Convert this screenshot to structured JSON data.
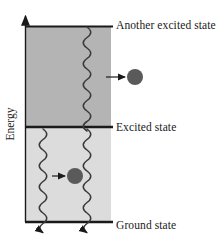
{
  "figure": {
    "kind": "energy-level-diagram",
    "axis": {
      "label": "Energy",
      "direction": "up"
    },
    "levels": [
      {
        "id": "another-excited",
        "label": "Another excited state",
        "y": 26
      },
      {
        "id": "excited",
        "label": "Excited state",
        "y": 127
      },
      {
        "id": "ground",
        "label": "Ground state",
        "y": 222
      }
    ],
    "bands": [
      {
        "id": "upper-band",
        "fill": "#b4b4b4",
        "top": 26,
        "bottom": 127
      },
      {
        "id": "lower-band",
        "fill": "#dcdcdc",
        "top": 127,
        "bottom": 222
      }
    ],
    "particles": [
      {
        "id": "upper-particle",
        "cx": 135,
        "cy": 77,
        "r": 8,
        "fill": "#5a5a5a"
      },
      {
        "id": "lower-particle",
        "cx": 75,
        "cy": 176,
        "r": 8,
        "fill": "#5a5a5a"
      }
    ],
    "pointer_arrows": [
      {
        "id": "upper-pointer",
        "x1": 106,
        "y1": 77,
        "x2": 125,
        "y2": 77
      },
      {
        "id": "lower-pointer",
        "x1": 52,
        "y1": 176,
        "x2": 65,
        "y2": 176
      }
    ],
    "wavy_transitions": [
      {
        "id": "upper-wave-right",
        "x": 87,
        "top": 27,
        "bottom": 127,
        "arrow": false
      },
      {
        "id": "lower-wave-left",
        "x": 43,
        "top": 128,
        "bottom": 221,
        "arrow": true
      },
      {
        "id": "lower-wave-right",
        "x": 87,
        "top": 128,
        "bottom": 221,
        "arrow": true
      }
    ],
    "colors": {
      "ink": "#1a1a1a",
      "upper_band": "#b4b4b4",
      "lower_band": "#dcdcdc",
      "particle": "#5a5a5a",
      "background": "#ffffff"
    }
  }
}
